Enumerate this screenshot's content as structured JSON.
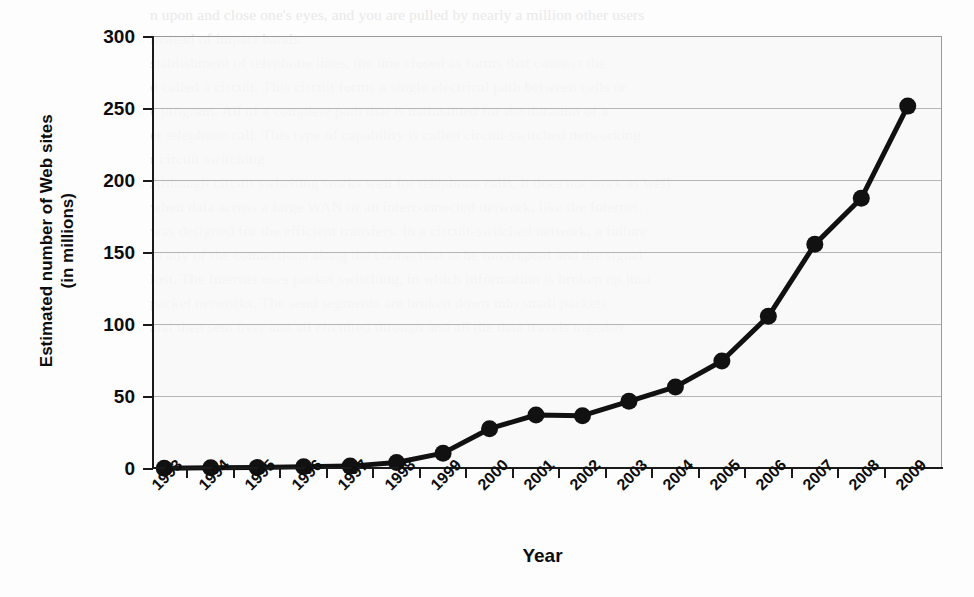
{
  "chart_data": {
    "type": "line",
    "title": "",
    "xlabel": "Year",
    "ylabel": "Estimated number of Web sites\n(in millions)",
    "ylabel_line1": "Estimated number of Web sites",
    "ylabel_line2": "(in millions)",
    "categories": [
      "1993",
      "1994",
      "1995",
      "1996",
      "1997",
      "1998",
      "1999",
      "2000",
      "2001",
      "2002",
      "2003",
      "2004",
      "2005",
      "2006",
      "2007",
      "2008",
      "2009"
    ],
    "values": [
      0.5,
      0.8,
      1.0,
      1.5,
      2.0,
      4.5,
      11,
      28,
      37.5,
      37,
      47,
      57,
      75,
      106,
      156,
      188,
      252
    ],
    "x": [
      "1993",
      "1994",
      "1995",
      "1996",
      "1997",
      "1998",
      "1999",
      "2000",
      "2001",
      "2002",
      "2003",
      "2004",
      "2005",
      "2006",
      "2007",
      "2008",
      "2009"
    ],
    "ylim": [
      0,
      300
    ],
    "yticks": [
      0,
      50,
      100,
      150,
      200,
      250,
      300
    ],
    "ytick_labels": [
      "0",
      "50",
      "100",
      "150",
      "200",
      "250",
      "300"
    ],
    "grid": true,
    "legend": "none",
    "marker": "filled-circle",
    "series_color": "#111111",
    "grid_color": "#b4b4b4",
    "plot_background": "#f7f7f7",
    "series": [
      {
        "name": "Estimated number of Web sites",
        "values": [
          0.5,
          0.8,
          1.0,
          1.5,
          2.0,
          4.5,
          11,
          28,
          37.5,
          37,
          47,
          57,
          75,
          106,
          156,
          188,
          252
        ]
      }
    ]
  },
  "page_bleed": {
    "note": "faint scanned text showing through behind the chart",
    "lines": [
      "n upon and close one's eyes, and you are pulled by nearly a million other users",
      "instead of impact bands.",
      "stablishment of telephone lines, the line closed as forms that connect the",
      "d called a circuit. This circuit forms a single electrical path between cells or",
      "e program. All of a complete path that is maintained for the duration of a",
      "er telephone call. This type of capability is called circuit-switched networking",
      "r circuit switching.",
      "Although circuit switching works well for telephone calls, it does not work as well",
      "when data across a large WAN or an interconnected network, like the Internet.",
      "was designed for the efficient transfers. In a circuit-switched network, a failure",
      "in any of the connections along the connection to be interrupted and the signal",
      "lost. The Internet uses packet switching, in which information is broken up into",
      "packet networks. The send segments are broken down into small packets",
      "and then sent over and all circuited through and all the data travels together"
    ]
  }
}
